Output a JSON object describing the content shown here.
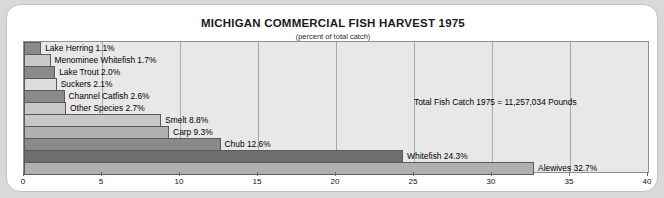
{
  "chart_data": {
    "type": "bar",
    "orientation": "horizontal",
    "title": "MICHIGAN COMMERCIAL FISH HARVEST 1975",
    "subtitle": "(percent of total catch)",
    "xlabel": "",
    "ylabel": "",
    "xlim": [
      0,
      40
    ],
    "xticks": [
      0,
      5,
      10,
      15,
      20,
      25,
      30,
      35,
      40
    ],
    "xtick_labels": [
      "0",
      "5",
      "10",
      "15",
      "20",
      "25",
      "30",
      "35",
      "40"
    ],
    "grid": true,
    "legend": "none",
    "annotation": "Total Fish Catch 1975 = 11,257,034 Pounds",
    "categories": [
      "Lake Herring",
      "Menominee Whitefish",
      "Lake Trout",
      "Suckers",
      "Channel Catfish",
      "Other Species",
      "Smelt",
      "Carp",
      "Chub",
      "Whitefish",
      "Alewives"
    ],
    "values": [
      1.1,
      1.7,
      2.0,
      2.1,
      2.6,
      2.7,
      8.8,
      9.3,
      12.6,
      24.3,
      32.7
    ],
    "bars": [
      {
        "label": "Lake Herring 1.1%",
        "name": "Lake Herring",
        "value": 1.1,
        "shade": "dark"
      },
      {
        "label": "Menominee Whitefish 1.7%",
        "name": "Menominee Whitefish",
        "value": 1.7,
        "shade": "light"
      },
      {
        "label": "Lake Trout 2.0%",
        "name": "Lake Trout",
        "value": 2.0,
        "shade": "dark"
      },
      {
        "label": "Suckers 2.1%",
        "name": "Suckers",
        "value": 2.1,
        "shade": "pale"
      },
      {
        "label": "Channel Catfish 2.6%",
        "name": "Channel Catfish",
        "value": 2.6,
        "shade": "dark"
      },
      {
        "label": "Other Species 2.7%",
        "name": "Other Species",
        "value": 2.7,
        "shade": "light"
      },
      {
        "label": "Smelt 8.8%",
        "name": "Smelt",
        "value": 8.8,
        "shade": "light"
      },
      {
        "label": "Carp 9.3%",
        "name": "Carp",
        "value": 9.3,
        "shade": "mid"
      },
      {
        "label": "Chub 12.6%",
        "name": "Chub",
        "value": 12.6,
        "shade": "dark"
      },
      {
        "label": "Whitefish 24.3%",
        "name": "Whitefish",
        "value": 24.3,
        "shade": "xdark"
      },
      {
        "label": "Alewives 32.7%",
        "name": "Alewives",
        "value": 32.7,
        "shade": "mid"
      }
    ]
  },
  "colors": {
    "page_background": "#d9d9d9",
    "card_background": "#ffffff",
    "plot_background": "#e8e8e8",
    "bar_border": "#5a5a5a",
    "gridline": "#a8a8a8",
    "text": "#000000"
  }
}
